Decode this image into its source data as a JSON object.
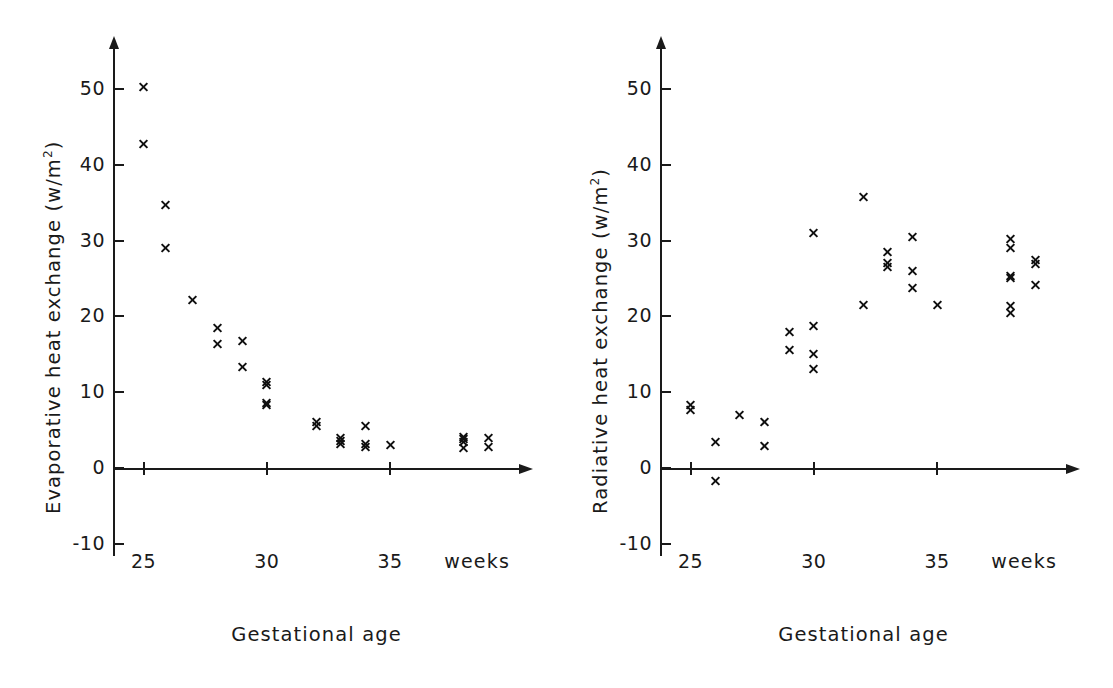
{
  "figure": {
    "background": "#ffffff",
    "marker_color": "#111111",
    "axis_color": "#1a1a1a",
    "marker_symbol": "x"
  },
  "chart_data": [
    {
      "type": "scatter",
      "panel": "left",
      "title": "",
      "xlabel": "Gestational age",
      "ylabel": "Evaporative heat exchange (w/m2)",
      "ylabel_display": "Evaporative heat exchange (w/m",
      "ylabel_sup": "2",
      "ylabel_tail": ")",
      "x_unit_label": "weeks",
      "xlim": [
        24.2,
        40.0
      ],
      "ylim": [
        -13,
        55
      ],
      "xticks": [
        25,
        30,
        35
      ],
      "xticklabels": [
        "25",
        "30",
        "35"
      ],
      "yticks": [
        -10,
        0,
        10,
        20,
        30,
        40,
        50
      ],
      "yticklabels": [
        "-10",
        "0",
        "10",
        "20",
        "30",
        "40",
        "50"
      ],
      "grid": false,
      "legend": "none",
      "points": [
        {
          "x": 25.0,
          "y": 50.3
        },
        {
          "x": 25.0,
          "y": 42.7
        },
        {
          "x": 25.9,
          "y": 34.7
        },
        {
          "x": 25.9,
          "y": 29.0
        },
        {
          "x": 27.0,
          "y": 22.2
        },
        {
          "x": 28.0,
          "y": 18.5
        },
        {
          "x": 28.0,
          "y": 16.4
        },
        {
          "x": 29.0,
          "y": 16.7
        },
        {
          "x": 29.0,
          "y": 13.3
        },
        {
          "x": 30.0,
          "y": 11.3
        },
        {
          "x": 30.0,
          "y": 10.9
        },
        {
          "x": 30.0,
          "y": 8.6
        },
        {
          "x": 30.0,
          "y": 8.3
        },
        {
          "x": 32.0,
          "y": 6.0
        },
        {
          "x": 32.0,
          "y": 5.5
        },
        {
          "x": 33.0,
          "y": 4.0
        },
        {
          "x": 33.0,
          "y": 3.6
        },
        {
          "x": 33.0,
          "y": 3.2
        },
        {
          "x": 34.0,
          "y": 5.5
        },
        {
          "x": 34.0,
          "y": 3.1
        },
        {
          "x": 34.0,
          "y": 2.7
        },
        {
          "x": 35.0,
          "y": 3.0
        },
        {
          "x": 38.0,
          "y": 4.1
        },
        {
          "x": 38.0,
          "y": 3.8
        },
        {
          "x": 38.0,
          "y": 3.4
        },
        {
          "x": 38.0,
          "y": 2.6
        },
        {
          "x": 39.0,
          "y": 4.0
        },
        {
          "x": 39.0,
          "y": 2.7
        }
      ]
    },
    {
      "type": "scatter",
      "panel": "right",
      "title": "",
      "xlabel": "Gestational age",
      "ylabel": "Radiative heat exchange (w/m2)",
      "ylabel_display": "Radiative heat exchange (w/m",
      "ylabel_sup": "2",
      "ylabel_tail": ")",
      "x_unit_label": "weeks",
      "xlim": [
        24.2,
        40.0
      ],
      "ylim": [
        -13,
        55
      ],
      "xticks": [
        25,
        30,
        35
      ],
      "xticklabels": [
        "25",
        "30",
        "35"
      ],
      "yticks": [
        -10,
        0,
        10,
        20,
        30,
        40,
        50
      ],
      "yticklabels": [
        "-10",
        "0",
        "10",
        "20",
        "30",
        "40",
        "50"
      ],
      "grid": false,
      "legend": "none",
      "points": [
        {
          "x": 25.0,
          "y": 8.3
        },
        {
          "x": 25.0,
          "y": 7.7
        },
        {
          "x": 26.0,
          "y": 3.4
        },
        {
          "x": 26.0,
          "y": -1.7
        },
        {
          "x": 27.0,
          "y": 7.0
        },
        {
          "x": 28.0,
          "y": 6.1
        },
        {
          "x": 28.0,
          "y": 2.9
        },
        {
          "x": 29.0,
          "y": 18.0
        },
        {
          "x": 29.0,
          "y": 15.5
        },
        {
          "x": 30.0,
          "y": 31.0
        },
        {
          "x": 30.0,
          "y": 18.7
        },
        {
          "x": 30.0,
          "y": 15.0
        },
        {
          "x": 30.0,
          "y": 13.0
        },
        {
          "x": 32.0,
          "y": 35.7
        },
        {
          "x": 32.0,
          "y": 21.5
        },
        {
          "x": 33.0,
          "y": 28.5
        },
        {
          "x": 33.0,
          "y": 27.0
        },
        {
          "x": 33.0,
          "y": 26.5
        },
        {
          "x": 34.0,
          "y": 30.5
        },
        {
          "x": 34.0,
          "y": 26.0
        },
        {
          "x": 34.0,
          "y": 23.7
        },
        {
          "x": 35.0,
          "y": 21.5
        },
        {
          "x": 38.0,
          "y": 30.2
        },
        {
          "x": 38.0,
          "y": 29.0
        },
        {
          "x": 38.0,
          "y": 25.3
        },
        {
          "x": 38.0,
          "y": 25.0
        },
        {
          "x": 38.0,
          "y": 21.3
        },
        {
          "x": 38.0,
          "y": 20.4
        },
        {
          "x": 39.0,
          "y": 27.4
        },
        {
          "x": 39.0,
          "y": 26.9
        },
        {
          "x": 39.0,
          "y": 24.2
        }
      ]
    }
  ]
}
